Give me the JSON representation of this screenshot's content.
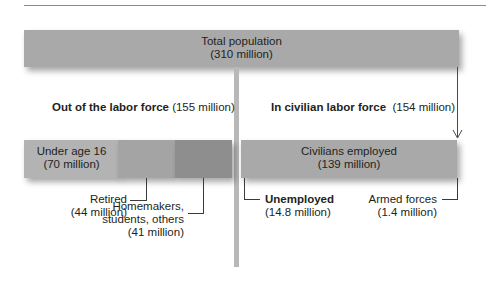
{
  "diagram": {
    "type": "labor-force-breakdown",
    "colors": {
      "total_box": "#a9a9a9",
      "under16_box": "#b3b3b3",
      "retired_box": "#a4a4a4",
      "homemakers_box": "#8e8e8e",
      "employed_box": "#a9a9a9",
      "divider": "#b8b8b8",
      "text": "#231f20"
    },
    "total": {
      "label": "Total population",
      "value": "(310 million)"
    },
    "out_of_labor_force": {
      "heading_bold": "Out of the labor force",
      "heading_value": "(155 million)",
      "under16": {
        "label": "Under age 16",
        "value": "(70 million)"
      },
      "retired": {
        "label": "Retired",
        "value": "(44 million)"
      },
      "homemakers": {
        "label_line1": "Homemakers,",
        "label_line2": "students, others",
        "value": "(41 million)"
      }
    },
    "in_labor_force": {
      "heading_bold": "In civilian labor force",
      "heading_value": "(154 million)",
      "employed": {
        "label": "Civilians employed",
        "value": "(139 million)"
      },
      "unemployed": {
        "label": "Unemployed",
        "value": "(14.8 million)"
      },
      "armed_forces": {
        "label": "Armed forces",
        "value": "(1.4 million)"
      }
    }
  }
}
